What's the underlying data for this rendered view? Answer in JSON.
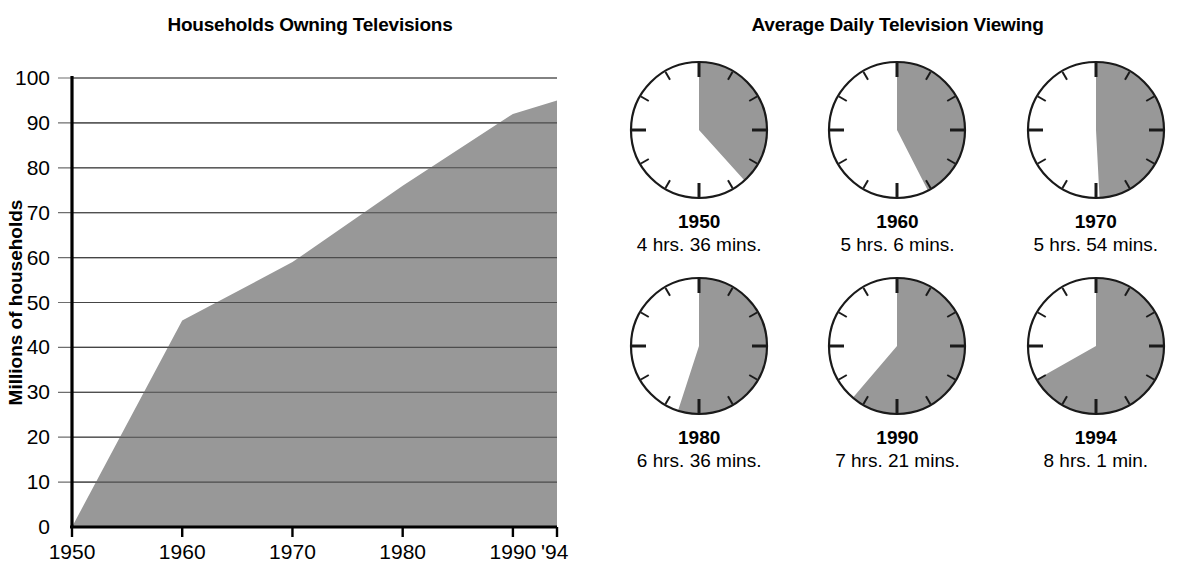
{
  "left": {
    "title": "Households Owning Televisions"
  },
  "right": {
    "title": "Average Daily Television Viewing"
  },
  "chart_data": [
    {
      "type": "area",
      "title": "Households Owning Televisions",
      "xlabel": "",
      "ylabel": "Millions of households",
      "x": [
        1950,
        1960,
        1970,
        1980,
        1990,
        1994
      ],
      "values": [
        0,
        46,
        59,
        76,
        92,
        95
      ],
      "xtick_labels": [
        "1950",
        "1960",
        "1970",
        "1980",
        "1990",
        "'94"
      ],
      "ytick_labels": [
        "0",
        "10",
        "20",
        "30",
        "40",
        "50",
        "60",
        "70",
        "80",
        "90",
        "100"
      ],
      "ytick_values": [
        0,
        10,
        20,
        30,
        40,
        50,
        60,
        70,
        80,
        90,
        100
      ],
      "ylim": [
        0,
        100
      ],
      "xlim": [
        1950,
        1994
      ],
      "grid": true,
      "fill_color": "#989898",
      "axis_color": "#000000",
      "grid_color": "#6e6e6e"
    },
    {
      "type": "pie",
      "title": "Average Daily Television Viewing",
      "unit": "hours of a 12-hour clock face",
      "clocks": [
        {
          "year": "1950",
          "duration": "4 hrs. 36 mins.",
          "hours": 4,
          "minutes": 36,
          "decimal_hours": 4.6
        },
        {
          "year": "1960",
          "duration": "5 hrs. 6 mins.",
          "hours": 5,
          "minutes": 6,
          "decimal_hours": 5.1
        },
        {
          "year": "1970",
          "duration": "5 hrs. 54 mins.",
          "hours": 5,
          "minutes": 54,
          "decimal_hours": 5.9
        },
        {
          "year": "1980",
          "duration": "6 hrs. 36 mins.",
          "hours": 6,
          "minutes": 36,
          "decimal_hours": 6.6
        },
        {
          "year": "1990",
          "duration": "7 hrs. 21 mins.",
          "hours": 7,
          "minutes": 21,
          "decimal_hours": 7.35
        },
        {
          "year": "1994",
          "duration": "8 hrs. 1 min.",
          "hours": 8,
          "minutes": 1,
          "decimal_hours": 8.017
        }
      ],
      "fill_color": "#989898",
      "outline_color": "#1a1a1a"
    }
  ]
}
